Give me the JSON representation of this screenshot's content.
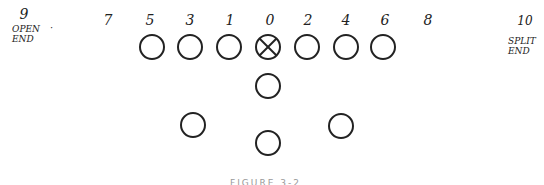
{
  "diagram": {
    "hole_numbers": [
      {
        "label": "9",
        "x": 24,
        "y": 8
      },
      {
        "label": "7",
        "x": 108,
        "y": 14
      },
      {
        "label": "5",
        "x": 150,
        "y": 14
      },
      {
        "label": "3",
        "x": 190,
        "y": 14
      },
      {
        "label": "1",
        "x": 230,
        "y": 14
      },
      {
        "label": "0",
        "x": 270,
        "y": 14
      },
      {
        "label": "2",
        "x": 308,
        "y": 14
      },
      {
        "label": "4",
        "x": 346,
        "y": 14
      },
      {
        "label": "6",
        "x": 385,
        "y": 14
      },
      {
        "label": "8",
        "x": 428,
        "y": 14
      },
      {
        "label": "10",
        "x": 525,
        "y": 16
      }
    ],
    "left_label_lines": [
      "OPEN",
      "END"
    ],
    "right_label_lines": [
      "SPLIT",
      "END"
    ],
    "line_players": [
      {
        "cx": 152,
        "cy": 47,
        "type": "circle"
      },
      {
        "cx": 190,
        "cy": 47,
        "type": "circle"
      },
      {
        "cx": 229,
        "cy": 47,
        "type": "circle"
      },
      {
        "cx": 268,
        "cy": 47,
        "type": "center-x"
      },
      {
        "cx": 307,
        "cy": 47,
        "type": "circle"
      },
      {
        "cx": 346,
        "cy": 47,
        "type": "circle"
      },
      {
        "cx": 383,
        "cy": 47,
        "type": "circle"
      }
    ],
    "backfield_players": [
      {
        "cx": 268,
        "cy": 87,
        "role": "quarterback"
      },
      {
        "cx": 193,
        "cy": 125,
        "role": "halfback-left"
      },
      {
        "cx": 341,
        "cy": 126,
        "role": "halfback-right"
      },
      {
        "cx": 268,
        "cy": 142,
        "role": "fullback"
      }
    ],
    "caption": "FIGURE 3-2",
    "stroke_color": "#222222"
  }
}
